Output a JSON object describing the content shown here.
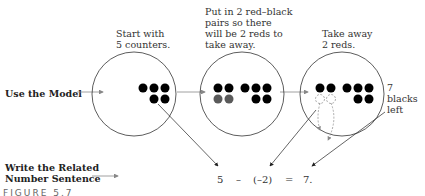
{
  "labels": {
    "step1": "Start with\n5 counters.",
    "step2": "Put in 2 red–black\npairs so there\nwill be 2 reds to\ntake away.",
    "step3": "Take away\n2 reds.",
    "use_model": "Use the Model",
    "write_sentence": "Write the Related\nNumber Sentence",
    "blacks_left": "7 blacks\nleft",
    "figure": "FIGURE 5.7"
  },
  "equation": {
    "a": "5",
    "op": "–",
    "b": "(–2)",
    "eq": "=",
    "result": "7."
  },
  "colors": {
    "black_counter": "#000000",
    "red_counter": "#5a5a5a",
    "arrow": "#888888",
    "circle": "#333333"
  },
  "model": {
    "circle1_counters": {
      "black": 5,
      "red": 0
    },
    "circle2_counters": {
      "black": 7,
      "red": 2
    },
    "circle3_counters": {
      "black": 7,
      "red": 0
    }
  }
}
